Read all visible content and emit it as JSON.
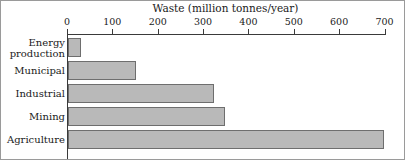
{
  "chart_data": {
    "type": "bar",
    "orientation": "horizontal",
    "title": "Waste (million tonnes/year)",
    "xlabel": "Waste (million tonnes/year)",
    "ylabel": "",
    "categories": [
      "Energy production",
      "Municipal",
      "Industrial",
      "Mining",
      "Agriculture"
    ],
    "values": [
      29,
      150,
      322,
      347,
      697
    ],
    "xlim": [
      0,
      700
    ],
    "xticks": [
      0,
      100,
      200,
      300,
      400,
      500,
      600,
      700
    ],
    "xtick_labels": [
      "0",
      "100",
      "200",
      "300",
      "400",
      "500",
      "600",
      "700"
    ],
    "grid": false,
    "legend": false,
    "bar_fill_color": "#b9b9b9",
    "bar_edge_color": "#6e6e6e",
    "axis_color": "#3a3a3a",
    "frame_color": "#9a9a9a"
  },
  "category_label_lines": [
    [
      "Energy",
      "production"
    ],
    [
      "Municipal"
    ],
    [
      "Industrial"
    ],
    [
      "Mining"
    ],
    [
      "Agriculture"
    ]
  ]
}
